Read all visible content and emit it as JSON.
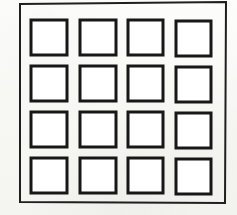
{
  "figure": {
    "style": "black ink line drawing on off-white scanned paper",
    "background_color": "#fbfbf9",
    "paper_color": "#f7f7f4",
    "ink_color": "#1a1a1a",
    "cell_fill_color": "#ffffff"
  },
  "canvas": {
    "width": 237,
    "height": 215
  },
  "outer_frame": {
    "label": "outer frame",
    "stroke_width": 2,
    "stroke_color": "#1f1f1f",
    "points": "20,4 226,2 225,203 20,202"
  },
  "grid": {
    "label": "square grid",
    "rows": 4,
    "columns": 4,
    "cell_count": 16,
    "cell_width": 36,
    "cell_height": 36,
    "column_gap": 13,
    "row_gap": 11,
    "stroke_width": 3,
    "stroke_color": "#171717",
    "cells": [
      {
        "id": "cell-r1c1",
        "row": 1,
        "column": 1,
        "x": 31,
        "y": 20,
        "w": 36,
        "h": 35
      },
      {
        "id": "cell-r1c2",
        "row": 1,
        "column": 2,
        "x": 80,
        "y": 20,
        "w": 36,
        "h": 35
      },
      {
        "id": "cell-r1c3",
        "row": 1,
        "column": 3,
        "x": 128,
        "y": 20,
        "w": 35,
        "h": 35
      },
      {
        "id": "cell-r1c4",
        "row": 1,
        "column": 4,
        "x": 176,
        "y": 21,
        "w": 35,
        "h": 35
      },
      {
        "id": "cell-r2c1",
        "row": 2,
        "column": 1,
        "x": 31,
        "y": 66,
        "w": 36,
        "h": 35
      },
      {
        "id": "cell-r2c2",
        "row": 2,
        "column": 2,
        "x": 80,
        "y": 66,
        "w": 36,
        "h": 35
      },
      {
        "id": "cell-r2c3",
        "row": 2,
        "column": 3,
        "x": 128,
        "y": 66,
        "w": 35,
        "h": 35
      },
      {
        "id": "cell-r2c4",
        "row": 2,
        "column": 4,
        "x": 176,
        "y": 67,
        "w": 35,
        "h": 35
      },
      {
        "id": "cell-r3c1",
        "row": 3,
        "column": 1,
        "x": 31,
        "y": 112,
        "w": 36,
        "h": 35
      },
      {
        "id": "cell-r3c2",
        "row": 3,
        "column": 2,
        "x": 80,
        "y": 112,
        "w": 36,
        "h": 35
      },
      {
        "id": "cell-r3c3",
        "row": 3,
        "column": 3,
        "x": 128,
        "y": 112,
        "w": 35,
        "h": 35
      },
      {
        "id": "cell-r3c4",
        "row": 3,
        "column": 4,
        "x": 176,
        "y": 113,
        "w": 35,
        "h": 35
      },
      {
        "id": "cell-r4c1",
        "row": 4,
        "column": 1,
        "x": 31,
        "y": 158,
        "w": 36,
        "h": 35
      },
      {
        "id": "cell-r4c2",
        "row": 4,
        "column": 2,
        "x": 80,
        "y": 158,
        "w": 36,
        "h": 35
      },
      {
        "id": "cell-r4c3",
        "row": 4,
        "column": 3,
        "x": 128,
        "y": 158,
        "w": 35,
        "h": 35
      },
      {
        "id": "cell-r4c4",
        "row": 4,
        "column": 4,
        "x": 176,
        "y": 159,
        "w": 35,
        "h": 35
      }
    ]
  }
}
